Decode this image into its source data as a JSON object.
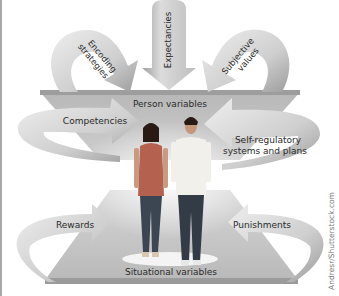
{
  "diagram": {
    "levels": {
      "top": "Person variables",
      "bottom": "Situational variables"
    },
    "arrows": [
      {
        "id": "encoding",
        "label_line1": "Encoding",
        "label_line2": "strategies"
      },
      {
        "id": "expectancies",
        "label_line1": "Expectancies"
      },
      {
        "id": "subjective",
        "label_line1": "Subjective",
        "label_line2": "values"
      },
      {
        "id": "competencies",
        "label_line1": "Competencies"
      },
      {
        "id": "selfreg",
        "label_line1": "Self-regulatory",
        "label_line2": "systems and plans"
      },
      {
        "id": "rewards",
        "label_line1": "Rewards"
      },
      {
        "id": "punishments",
        "label_line1": "Punishments"
      }
    ],
    "credit": "Andresr/Shutterstock.com",
    "colors": {
      "platform": "#b4b4b4",
      "platform_edge": "#9a9a9a",
      "arrow_light": "#e6e6e6",
      "arrow_dark": "#a0a0a0",
      "woman_top": "#b0604f",
      "jeans": "#3b4652",
      "man_shirt": "#f2f0ea"
    }
  }
}
